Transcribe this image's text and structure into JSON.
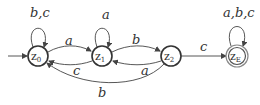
{
  "diagram": {
    "type": "finite-automaton",
    "states": [
      {
        "id": "z0",
        "label": "z",
        "sub": "0",
        "initial": true,
        "final": false
      },
      {
        "id": "z1",
        "label": "z",
        "sub": "1",
        "initial": false,
        "final": false
      },
      {
        "id": "z2",
        "label": "z",
        "sub": "2",
        "initial": false,
        "final": false
      },
      {
        "id": "zE",
        "label": "z",
        "sub": "E",
        "initial": false,
        "final": true
      }
    ],
    "transitions": [
      {
        "from": "z0",
        "to": "z0",
        "label": "b,c"
      },
      {
        "from": "z0",
        "to": "z1",
        "label": "a"
      },
      {
        "from": "z1",
        "to": "z0",
        "label": "c"
      },
      {
        "from": "z1",
        "to": "z1",
        "label": "a"
      },
      {
        "from": "z1",
        "to": "z2",
        "label": "b"
      },
      {
        "from": "z2",
        "to": "z1",
        "label": "a"
      },
      {
        "from": "z2",
        "to": "z0",
        "label": "b"
      },
      {
        "from": "z2",
        "to": "zE",
        "label": "c"
      },
      {
        "from": "zE",
        "to": "zE",
        "label": "a,b,c"
      }
    ]
  }
}
